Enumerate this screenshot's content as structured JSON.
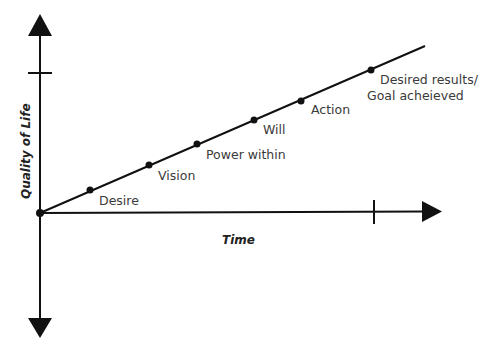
{
  "diagram": {
    "axes": {
      "x_label": "Time",
      "y_label": "Quality of Life",
      "color": "#111111"
    },
    "progress_line": {
      "start": [
        40,
        213
      ],
      "end": [
        425,
        46
      ],
      "color": "#111111"
    },
    "milestones": [
      {
        "id": "origin",
        "label": "",
        "x": 40,
        "y": 213
      },
      {
        "id": "desire",
        "label": "Desire",
        "x": 90,
        "y": 190
      },
      {
        "id": "vision",
        "label": "Vision",
        "x": 149,
        "y": 165
      },
      {
        "id": "power-within",
        "label": "Power within",
        "x": 197,
        "y": 144
      },
      {
        "id": "will",
        "label": "Will",
        "x": 254,
        "y": 120
      },
      {
        "id": "action",
        "label": "Action",
        "x": 301,
        "y": 101
      },
      {
        "id": "desired-results",
        "label": "Desired results/",
        "label_line2": "Goal acheieved",
        "x": 371,
        "y": 70
      }
    ]
  }
}
